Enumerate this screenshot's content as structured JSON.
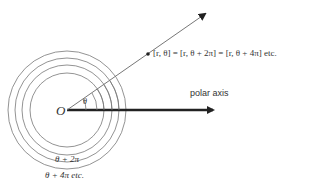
{
  "diagram": {
    "origin_label": "O",
    "angle_label": "θ",
    "axis_label": "polar axis",
    "point_label": "[r, θ] = [r, θ + 2π] = [r, θ + 4π] etc.",
    "angle_2pi_label": "θ + 2π",
    "angle_4pi_label": "θ + 4π etc."
  }
}
